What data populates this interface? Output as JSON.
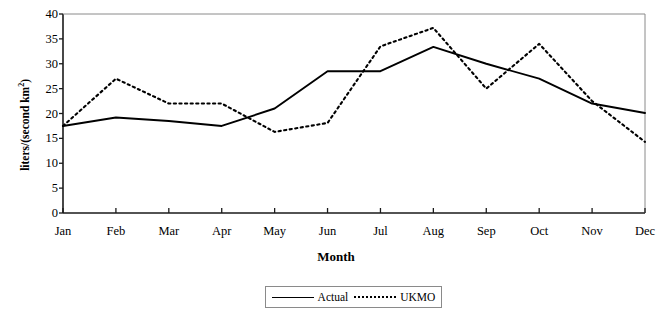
{
  "chart_data": {
    "type": "line",
    "title": "",
    "xlabel": "Month",
    "ylabel": "liters/(second km²)",
    "categories": [
      "Jan",
      "Feb",
      "Mar",
      "Apr",
      "May",
      "Jun",
      "Jul",
      "Aug",
      "Sep",
      "Oct",
      "Nov",
      "Dec"
    ],
    "series": [
      {
        "name": "Actual",
        "style": "solid",
        "color": "#000000",
        "values": [
          17.5,
          19.2,
          18.5,
          17.5,
          21.0,
          28.5,
          28.5,
          33.4,
          30.0,
          27.0,
          22.0,
          20.1
        ]
      },
      {
        "name": "UKMO",
        "style": "dotted",
        "color": "#000000",
        "values": [
          17.5,
          27.0,
          22.0,
          22.0,
          16.3,
          18.1,
          33.5,
          37.2,
          25.0,
          34.0,
          22.5,
          14.3
        ]
      }
    ],
    "ylim": [
      0,
      40
    ],
    "yticks": [
      0,
      5,
      10,
      15,
      20,
      25,
      30,
      35,
      40
    ],
    "ytick_labels": [
      "0",
      "5",
      "10",
      "15",
      "20",
      "25",
      "30",
      "35",
      "40"
    ],
    "grid": false,
    "legend_position": "bottom"
  },
  "axes": {
    "y_title_main": "liters/(second km",
    "y_title_sup": "2",
    "y_title_close": ")",
    "x_title": "Month"
  },
  "legend": {
    "entries": [
      {
        "label": "Actual",
        "style": "solid"
      },
      {
        "label": "UKMO",
        "style": "dotted"
      }
    ]
  }
}
